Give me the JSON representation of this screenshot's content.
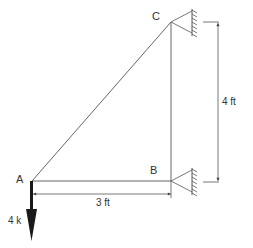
{
  "diagram": {
    "type": "truss-structure",
    "nodes": [
      {
        "id": "A",
        "label": "A",
        "x": 32,
        "y": 181
      },
      {
        "id": "B",
        "label": "B",
        "x": 171,
        "y": 181
      },
      {
        "id": "C",
        "label": "C",
        "x": 171,
        "y": 22
      }
    ],
    "members": [
      {
        "from": "A",
        "to": "B"
      },
      {
        "from": "A",
        "to": "C"
      },
      {
        "from": "B",
        "to": "C"
      }
    ],
    "supports": [
      {
        "node": "C",
        "type": "pin-to-wall"
      },
      {
        "node": "B",
        "type": "pin-to-wall"
      }
    ],
    "load": {
      "node": "A",
      "label": "4 k",
      "direction": "down"
    },
    "dimensions": {
      "horizontal": {
        "label": "3 ft",
        "from": "A",
        "to": "B"
      },
      "vertical": {
        "label": "4 ft",
        "from": "B",
        "to": "C"
      }
    },
    "colors": {
      "line": "#555555",
      "load": "#1a1a1a",
      "text": "#333333"
    }
  }
}
